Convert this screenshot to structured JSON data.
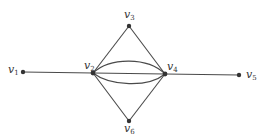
{
  "diagram": {
    "type": "multigraph",
    "nodes": [
      {
        "id": "v1",
        "label": "v",
        "sub": "1",
        "x": 23,
        "y": 72
      },
      {
        "id": "v2",
        "label": "v",
        "sub": "2",
        "x": 93,
        "y": 73
      },
      {
        "id": "v3",
        "label": "v",
        "sub": "3",
        "x": 129,
        "y": 26
      },
      {
        "id": "v4",
        "label": "v",
        "sub": "4",
        "x": 165,
        "y": 74
      },
      {
        "id": "v5",
        "label": "v",
        "sub": "5",
        "x": 239,
        "y": 75
      },
      {
        "id": "v6",
        "label": "v",
        "sub": "6",
        "x": 129,
        "y": 121
      }
    ],
    "edges": [
      {
        "from": "v1",
        "to": "v2"
      },
      {
        "from": "v2",
        "to": "v3"
      },
      {
        "from": "v3",
        "to": "v4"
      },
      {
        "from": "v2",
        "to": "v6"
      },
      {
        "from": "v6",
        "to": "v4"
      },
      {
        "from": "v4",
        "to": "v5"
      },
      {
        "from": "v2",
        "to": "v4",
        "curve": "straight"
      },
      {
        "from": "v2",
        "to": "v4",
        "curve": "upper"
      },
      {
        "from": "v2",
        "to": "v4",
        "curve": "lower"
      }
    ],
    "edge_color": "#4a4a4a",
    "node_color": "#333333"
  }
}
